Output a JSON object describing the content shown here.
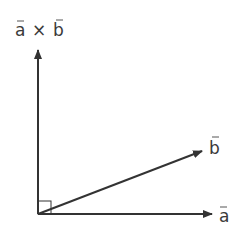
{
  "diagram": {
    "colors": {
      "stroke": "#333333",
      "text": "#3a3a3a",
      "background": "#ffffff"
    },
    "origin": [
      38,
      214
    ],
    "vectors": [
      {
        "id": "a",
        "label": "a",
        "tip": [
          214,
          214
        ]
      },
      {
        "id": "b",
        "label": "b",
        "tip": [
          204,
          150
        ]
      },
      {
        "id": "axb",
        "label_left": "a",
        "operator": "×",
        "label_right": "b",
        "tip": [
          38,
          48
        ]
      }
    ],
    "right_angle_marker": {
      "size": 13
    }
  }
}
